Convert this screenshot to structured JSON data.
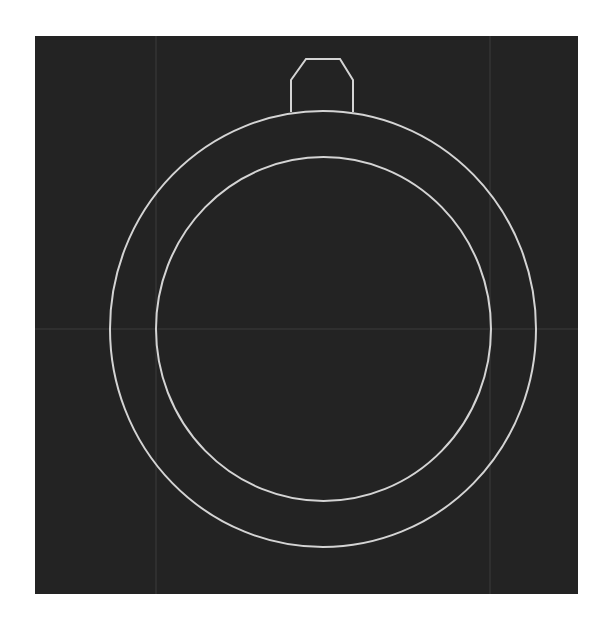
{
  "diagram": {
    "type": "cad-wireframe",
    "colors": {
      "background": "#232323",
      "page": "#ffffff",
      "stroke": "#d4d4d4",
      "grid": "#3c3c3c"
    },
    "canvas": {
      "x": 35,
      "y": 36,
      "width": 543,
      "height": 558
    },
    "grid": {
      "vertical_x": [
        156,
        490
      ],
      "horizontal_y": [
        329
      ]
    },
    "outer_ring": {
      "cx": 323,
      "cy": 329,
      "rx": 213,
      "ry": 218
    },
    "inner_ring": {
      "cx": 323.5,
      "cy": 329,
      "rx": 167.5,
      "ry": 172
    },
    "crown": {
      "points": "291,112 291,80 306,59 340,59 353,80 353,112"
    }
  }
}
